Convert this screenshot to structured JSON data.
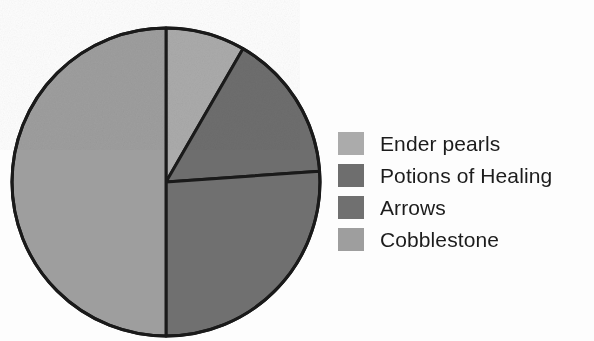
{
  "chart_data": {
    "type": "pie",
    "title": "",
    "subtitle": "",
    "xlabel": "",
    "ylabel": "",
    "legend_position": "right",
    "grid": false,
    "start_angle_deg": 0,
    "direction": "clockwise",
    "categories": [
      "Ender pearls",
      "Potions of Healing",
      "Arrows",
      "Cobblestone"
    ],
    "values": [
      8.3,
      15.6,
      26.1,
      50.0
    ],
    "value_unit": "percent",
    "slice_angles_deg": [
      30,
      56,
      94,
      180
    ],
    "colors": [
      "#ababab",
      "#6e6e6e",
      "#707070",
      "#9e9e9e"
    ],
    "slices": [
      {
        "label": "Ender pearls",
        "value": 8.3,
        "angle_deg": 30,
        "start_deg": 0,
        "end_deg": 30,
        "color": "#ababab"
      },
      {
        "label": "Potions of Healing",
        "value": 15.6,
        "angle_deg": 56,
        "start_deg": 30,
        "end_deg": 86,
        "color": "#6e6e6e"
      },
      {
        "label": "Arrows",
        "value": 26.1,
        "angle_deg": 94,
        "start_deg": 86,
        "end_deg": 180,
        "color": "#707070"
      },
      {
        "label": "Cobblestone",
        "value": 50.0,
        "angle_deg": 180,
        "start_deg": 180,
        "end_deg": 360,
        "color": "#9e9e9e"
      }
    ]
  },
  "chart": {
    "outline_color": "#1a1a1a",
    "background": "#fdfdfd",
    "center_x": 158,
    "center_y": 158,
    "radius": 154
  },
  "legend": {
    "items": [
      {
        "label": "Ender pearls",
        "color": "#ababab"
      },
      {
        "label": "Potions of Healing",
        "color": "#6e6e6e"
      },
      {
        "label": "Arrows",
        "color": "#707070"
      },
      {
        "label": "Cobblestone",
        "color": "#9e9e9e"
      }
    ]
  }
}
